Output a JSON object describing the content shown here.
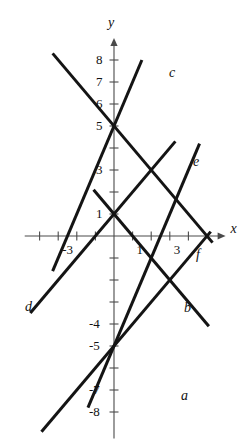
{
  "figure": {
    "width": 246,
    "height": 440,
    "background": "#ffffff",
    "line_color": "#141414",
    "axis_color": "#4a4a4a"
  },
  "axes": {
    "x_name": "x",
    "y_name": "y",
    "origin_px": {
      "x": 114,
      "y": 236
    },
    "unit_px": {
      "x": 18.6,
      "y": 22.0
    },
    "x_range": [
      -4.8,
      6.0
    ],
    "y_range": [
      -9.2,
      9.0
    ],
    "grid": false
  },
  "x_ticks": [
    {
      "value": -4,
      "label": ""
    },
    {
      "value": -3,
      "label": "-3"
    },
    {
      "value": -2,
      "label": ""
    },
    {
      "value": -1,
      "label": ""
    },
    {
      "value": 1,
      "label": "1"
    },
    {
      "value": 2,
      "label": ""
    },
    {
      "value": 3,
      "label": "3"
    },
    {
      "value": 4,
      "label": ""
    }
  ],
  "y_ticks": [
    {
      "value": 8,
      "label": "8"
    },
    {
      "value": 7,
      "label": "7"
    },
    {
      "value": 6,
      "label": "6"
    },
    {
      "value": 5,
      "label": "5"
    },
    {
      "value": 4,
      "label": ""
    },
    {
      "value": 3,
      "label": "3"
    },
    {
      "value": 2,
      "label": ""
    },
    {
      "value": 1,
      "label": "1"
    },
    {
      "value": -1,
      "label": ""
    },
    {
      "value": -2,
      "label": ""
    },
    {
      "value": -3,
      "label": ""
    },
    {
      "value": -4,
      "label": "-4"
    },
    {
      "value": -5,
      "label": "-5"
    },
    {
      "value": -6,
      "label": ""
    },
    {
      "value": -7,
      "label": "-7"
    },
    {
      "value": -8,
      "label": "-8"
    }
  ],
  "chart_data": {
    "type": "line",
    "title": "",
    "xlabel": "x",
    "ylabel": "y",
    "xlim": [
      -4.8,
      6.0
    ],
    "ylim": [
      -9.2,
      9.0
    ],
    "grid": false,
    "legend": "inline-end-labels",
    "series": [
      {
        "name": "a",
        "label": "a",
        "slope": -1,
        "intercept": 1,
        "equation": "y = -x + 1",
        "x_start": -1.1,
        "x_end": 5.1,
        "label_px": {
          "x": 181,
          "y": 389
        }
      },
      {
        "name": "b",
        "label": "b",
        "slope": -1,
        "intercept": 5,
        "equation": "y = -x + 5",
        "x_start": -3.3,
        "x_end": 5.3,
        "label_px": {
          "x": 184,
          "y": 301
        }
      },
      {
        "name": "c",
        "label": "c",
        "slope": 2,
        "intercept": 5,
        "equation": "y = 2x + 5",
        "x_start": -3.3,
        "x_end": 1.5,
        "label_px": {
          "x": 169,
          "y": 66
        }
      },
      {
        "name": "d",
        "label": "d",
        "slope": 1,
        "intercept": 1,
        "equation": "y = x + 1",
        "x_start": -4.5,
        "x_end": 3.3,
        "label_px": {
          "x": 25,
          "y": 300
        }
      },
      {
        "name": "e",
        "label": "e",
        "slope": 2,
        "intercept": -5,
        "equation": "y = 2x - 5",
        "x_start": -1.4,
        "x_end": 4.6,
        "label_px": {
          "x": 193,
          "y": 155
        }
      },
      {
        "name": "f",
        "label": "f",
        "slope": 1,
        "intercept": -5,
        "equation": "y = x - 5",
        "x_start": -3.9,
        "x_end": 5.2,
        "label_px": {
          "x": 196,
          "y": 248
        }
      }
    ]
  }
}
